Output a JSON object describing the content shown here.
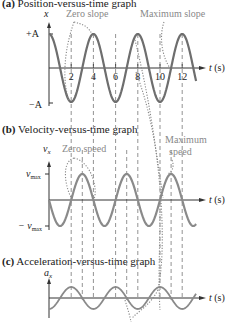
{
  "chart_data": [
    {
      "type": "line",
      "title": "(a) Position-versus-time graph",
      "title_bold": "(a)",
      "title_rest": " Position-versus-time graph",
      "xlabel": "t (s)",
      "ylabel": "x",
      "yticks": [
        "+A",
        "−A"
      ],
      "xticks": [
        "2",
        "4",
        "6",
        "8",
        "10",
        "12"
      ],
      "function": "x = A cos(πt/2)",
      "period_s": 4,
      "x": [
        0,
        1,
        2,
        3,
        4,
        5,
        6,
        7,
        8,
        9,
        10,
        11,
        12,
        13
      ],
      "values": [
        1,
        0,
        -1,
        0,
        1,
        0,
        -1,
        0,
        1,
        0,
        -1,
        0,
        1,
        0
      ],
      "annotations": [
        "Zero slope",
        "Maximum slope"
      ]
    },
    {
      "type": "line",
      "title": "(b) Velocity-versus-time graph",
      "title_bold": "(b)",
      "title_rest": " Velocity-versus-time graph",
      "xlabel": "t (s)",
      "ylabel": "vx",
      "yticks": [
        "vmax",
        "−vmax"
      ],
      "function": "vx = −vmax sin(πt/2)",
      "x": [
        0,
        1,
        2,
        3,
        4,
        5,
        6,
        7,
        8,
        9,
        10,
        11,
        12,
        13
      ],
      "values": [
        0,
        -1,
        0,
        1,
        0,
        -1,
        0,
        1,
        0,
        -1,
        0,
        1,
        0,
        -1
      ],
      "annotations": [
        "Zero speed",
        "Maximum speed"
      ]
    },
    {
      "type": "line",
      "title": "(c) Acceleration-versus-time graph",
      "title_bold": "(c)",
      "title_rest": " Acceleration-versus-time graph",
      "xlabel": "t (s)",
      "ylabel": "ax",
      "function": "ax = −amax cos(πt/2)",
      "x": [
        0,
        1,
        2,
        3,
        4,
        5,
        6,
        7,
        8,
        9,
        10,
        11,
        12,
        13
      ],
      "values": [
        -1,
        0,
        1,
        0,
        -1,
        0,
        1,
        0,
        -1,
        0,
        1,
        0,
        -1,
        0
      ]
    }
  ],
  "labels": {
    "a_bold": "(a)",
    "a_rest": " Position-versus-time graph",
    "b_bold": "(b)",
    "b_rest": " Velocity-versus-time graph",
    "c_bold": "(c)",
    "c_rest": " Acceleration-versus-time graph",
    "x_axis": "x",
    "plus_a": "+A",
    "minus_a": "−A",
    "t_axis": "t (s)",
    "vx": "v",
    "vx_sub": "x",
    "vmax": "v",
    "vmax_sub": "max",
    "minus_vmax": "− v",
    "ax": "a",
    "ax_sub": "x",
    "zero_slope": "Zero slope",
    "max_slope": "Maximum slope",
    "zero_speed": "Zero speed",
    "max_speed_1": "Maximum",
    "max_speed_2": "speed",
    "ticks": [
      "2",
      "4",
      "6",
      "8",
      "10",
      "12"
    ]
  },
  "colors": {
    "curve": "#6e6e6e",
    "axis": "#333333",
    "dash": "#777777",
    "annotation": "#888888"
  }
}
